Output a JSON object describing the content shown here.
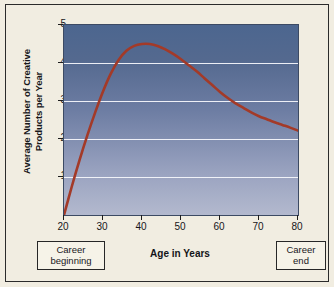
{
  "chart_data": {
    "type": "line",
    "title": "",
    "xlabel": "Age in Years",
    "ylabel_lines": [
      "Average Number of Creative",
      "Products per Year"
    ],
    "ylabel": "Average Number of Creative Products per Year",
    "xlim": [
      20,
      80
    ],
    "ylim": [
      0,
      5
    ],
    "xticks": [
      20,
      30,
      40,
      50,
      60,
      70,
      80
    ],
    "yticks": [
      1,
      2,
      3,
      4,
      5
    ],
    "grid": "horizontal",
    "gridlines_at": [
      1,
      2,
      3,
      4
    ],
    "legend": null,
    "series": [
      {
        "name": "Average number of creative products per year",
        "color": "#a33a28",
        "x": [
          20,
          22,
          24,
          26,
          28,
          30,
          32,
          34,
          36,
          38,
          40,
          42,
          44,
          46,
          48,
          50,
          52,
          54,
          56,
          58,
          60,
          62,
          64,
          66,
          68,
          70,
          72,
          74,
          76,
          78,
          80
        ],
        "y": [
          0.0,
          0.75,
          1.45,
          2.1,
          2.7,
          3.25,
          3.72,
          4.08,
          4.32,
          4.45,
          4.5,
          4.5,
          4.45,
          4.36,
          4.24,
          4.1,
          3.94,
          3.78,
          3.6,
          3.42,
          3.24,
          3.08,
          2.94,
          2.82,
          2.7,
          2.6,
          2.52,
          2.44,
          2.37,
          2.3,
          2.22
        ]
      }
    ],
    "annotations": [
      {
        "name": "career-beginning",
        "lines": [
          "Career",
          "beginning"
        ],
        "at_x": 20
      },
      {
        "name": "career-end",
        "lines": [
          "Career",
          "end"
        ],
        "at_x": 80
      }
    ],
    "colors": {
      "curve": "#a33a28",
      "gridline": "#f4f6fb",
      "plot_top": "#4c668f",
      "plot_bottom": "#b3b9ce",
      "page_background": "#f1ede1",
      "frame": "#2b2b2b"
    }
  }
}
